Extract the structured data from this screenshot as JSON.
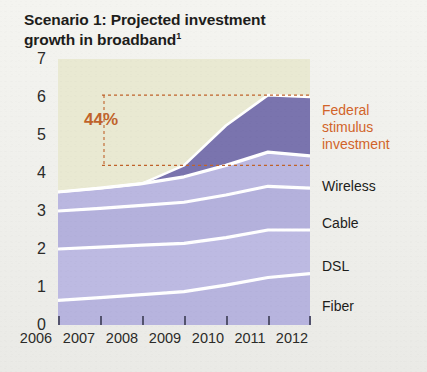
{
  "title": {
    "line1": "Scenario 1: Projected investment",
    "line2": "growth in broadband",
    "footnote_marker": "1"
  },
  "annotation": {
    "growth_label": "44%",
    "upper_line_value": 6.05,
    "lower_line_value": 4.2
  },
  "series_labels": {
    "federal": "Federal stimulus investment",
    "wireless": "Wireless",
    "cable": "Cable",
    "dsl": "DSL",
    "fiber": "Fiber"
  },
  "colors": {
    "plot_background": "#e9e9d2",
    "federal": "#7a74ae",
    "wireless": "#bab7e0",
    "cable": "#b4b1dc",
    "dsl": "#bdbae2",
    "fiber": "#b7b4de",
    "separator": "#ffffff",
    "accent": "#c0632b",
    "axis_text": "#2b2b29"
  },
  "chart_data": {
    "type": "area",
    "title": "Scenario 1: Projected investment growth in broadband",
    "xlabel": "",
    "ylabel": "",
    "stacked": true,
    "grid": false,
    "legend_position": "right",
    "ylim": [
      0,
      7
    ],
    "xlim": [
      2006,
      2012
    ],
    "ytick_labels": [
      "0",
      "1",
      "2",
      "3",
      "4",
      "5",
      "6",
      "7"
    ],
    "ytick_values": [
      0,
      1,
      2,
      3,
      4,
      5,
      6,
      7
    ],
    "categories": [
      "2006",
      "2007",
      "2008",
      "2009",
      "2010",
      "2011",
      "2012"
    ],
    "x": [
      2006,
      2007,
      2008,
      2009,
      2010,
      2011,
      2012
    ],
    "series": [
      {
        "name": "Fiber",
        "values": [
          0.65,
          0.72,
          0.8,
          0.88,
          1.05,
          1.25,
          1.35
        ]
      },
      {
        "name": "DSL",
        "values": [
          1.35,
          1.33,
          1.3,
          1.27,
          1.25,
          1.25,
          1.15
        ]
      },
      {
        "name": "Cable",
        "values": [
          1.0,
          1.02,
          1.05,
          1.08,
          1.12,
          1.15,
          1.1
        ]
      },
      {
        "name": "Wireless",
        "values": [
          0.5,
          0.53,
          0.57,
          0.67,
          0.78,
          0.9,
          0.85
        ]
      },
      {
        "name": "Federal stimulus investment",
        "values": [
          0.0,
          0.0,
          0.0,
          0.3,
          1.05,
          1.5,
          1.55
        ]
      }
    ],
    "cumulative_tops": {
      "Fiber": [
        0.65,
        0.72,
        0.8,
        0.88,
        1.05,
        1.25,
        1.35
      ],
      "DSL": [
        2.0,
        2.05,
        2.1,
        2.15,
        2.3,
        2.5,
        2.5
      ],
      "Cable": [
        3.0,
        3.07,
        3.15,
        3.23,
        3.42,
        3.65,
        3.6
      ],
      "Wireless": [
        3.5,
        3.6,
        3.72,
        3.9,
        4.2,
        4.55,
        4.45
      ],
      "Total": [
        3.5,
        3.6,
        3.72,
        4.2,
        5.25,
        6.05,
        6.0
      ]
    },
    "annotations": [
      {
        "text": "44%",
        "type": "growth-bracket",
        "from_value": 4.2,
        "to_value": 6.05
      }
    ]
  }
}
